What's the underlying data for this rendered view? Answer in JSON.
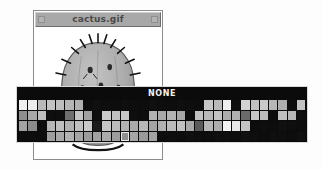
{
  "window": {
    "title": "cactus.gif",
    "left_control_icon": "window-control-box-icon",
    "right_control_icon": "window-control-box-icon",
    "canvas_image_name": "cactus-illustration"
  },
  "palette": {
    "label": "NONE",
    "background_color": "#0b0b0b",
    "border_color": "#d8d8d8",
    "selected_index": {
      "row": 3,
      "col": 11
    },
    "selection_outline_color": "#e8e8e8",
    "rows": [
      [
        "#f0f0f0",
        "#ededed",
        "#b9b9b9",
        "#c3c3c3",
        "#bdbdbd",
        "#b5b5b5",
        "#b0b0b0",
        "#0d0d0d",
        "#101010",
        "#0e0e0e",
        "#0d0d0d",
        "#0f0f0f",
        "#0e0e0e",
        "#0d0d0d",
        "#101010",
        "#0e0e0e",
        "#0d0d0d",
        "#0f0f0f",
        "#0e0e0e",
        "#0d0d0d",
        "#c7c7c7",
        "#b9b9b9",
        "#eeeeee",
        "#0e0e0e",
        "#d2d2d2",
        "#c0c0c0",
        "#c9c9c9",
        "#b7b7b7",
        "#aeaeae",
        "#0d0d0d",
        "#c3c3c3"
      ],
      [
        "#8e8e8e",
        "#a8a8a8",
        "#bdbdbd",
        "#0d0d0d",
        "#0e0e0e",
        "#6e6e6e",
        "#c4c4c4",
        "#a0a0a0",
        "#0d0d0d",
        "#c9c9c9",
        "#bfbfbf",
        "#c6c6c6",
        "#0e0e0e",
        "#0d0d0d",
        "#b2b2b2",
        "#a9a9a9",
        "#b4b4b4",
        "#a7a7a7",
        "#0d0d0d",
        "#c1c1c1",
        "#b8b8b8",
        "#c4c4c4",
        "#adadad",
        "#b1b1b1",
        "#6a6a6a",
        "#c7c7c7",
        "#bcbcbc",
        "#0d0d0d",
        "#c0c0c0",
        "#b6b6b6",
        "#0e0e0e"
      ],
      [
        "#a2a2a2",
        "#8b8b8b",
        "#0d0d0d",
        "#b6b6b6",
        "#bebebe",
        "#b1b1b1",
        "#c0c0c0",
        "#c8c8c8",
        "#1a1a1a",
        "#c5c5c5",
        "#bcbcbc",
        "#b3b3b3",
        "#aaaaaa",
        "#b8b8b8",
        "#a4a4a4",
        "#b0b0b0",
        "#bbbbbb",
        "#c2c2c2",
        "#a8a8a8",
        "#5a5a5a",
        "#b7b7b7",
        "#aeaeae",
        "#f4f4f4",
        "#e6e6e6",
        "#c3c3c3",
        "#0d0d0d",
        "#0e0e0e",
        "#0d0d0d",
        "#101010",
        "#0e0e0e",
        "#0d0d0d"
      ],
      [
        "#0d0d0d",
        "#0e0e0e",
        "#0d0d0d",
        "#9e9e9e",
        "#a8a8a8",
        "#b2b2b2",
        "#a5a5a5",
        "#9b9b9b",
        "#a1a1a1",
        "#aaaaaa",
        "#9d9d9d",
        "#8f8f8f",
        "#a6a6a6",
        "#9a9a9a",
        "#a3a3a3",
        "#0d0d0d",
        "#0e0e0e",
        "#0d0d0d",
        "#101010",
        "#0e0e0e",
        "#0d0d0d",
        "#0f0f0f",
        "#0e0e0e",
        "#0d0d0d",
        "#101010",
        "#0e0e0e",
        "#0d0d0d",
        "#0f0f0f",
        "#0e0e0e",
        "#0d0d0d",
        "#101010"
      ]
    ]
  }
}
